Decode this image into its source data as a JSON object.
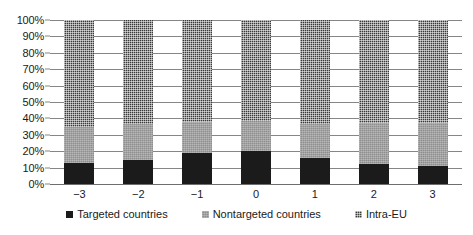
{
  "chart_data": {
    "type": "bar",
    "stacked": true,
    "stack_mode": "percent",
    "title": "",
    "subtitle": "",
    "xlabel": "",
    "ylabel": "",
    "categories": [
      "−3",
      "−2",
      "−1",
      "0",
      "1",
      "2",
      "3"
    ],
    "series": [
      {
        "name": "Targeted countries",
        "color": "#1b1b1b",
        "pattern": "solid-black",
        "values": [
          12.8,
          14.7,
          19.0,
          20.0,
          15.8,
          12.0,
          11.0
        ]
      },
      {
        "name": "Nontargeted countries",
        "color": "#8e8e8e",
        "pattern": "light-gray-weave",
        "values": [
          22.0,
          22.0,
          19.0,
          18.5,
          20.7,
          25.0,
          26.5
        ]
      },
      {
        "name": "Intra-EU",
        "color": "#3a3a3a",
        "pattern": "dark-checkerboard",
        "values": [
          65.2,
          63.3,
          62.0,
          61.5,
          63.5,
          63.0,
          62.5
        ]
      }
    ],
    "ylim": [
      0,
      100
    ],
    "ytick_labels": [
      "0%",
      "10%",
      "20%",
      "30%",
      "40%",
      "50%",
      "60%",
      "70%",
      "80%",
      "90%",
      "100%"
    ],
    "ytick_values": [
      0,
      10,
      20,
      30,
      40,
      50,
      60,
      70,
      80,
      90,
      100
    ],
    "grid": "horizontal",
    "legend_position": "bottom"
  },
  "legend": {
    "items": [
      {
        "label": "Targeted countries",
        "swatch_name": "legend-swatch-targeted-countries"
      },
      {
        "label": "Nontargeted countries",
        "swatch_name": "legend-swatch-nontargeted-countries"
      },
      {
        "label": "Intra-EU",
        "swatch_name": "legend-swatch-intra-eu"
      }
    ]
  }
}
